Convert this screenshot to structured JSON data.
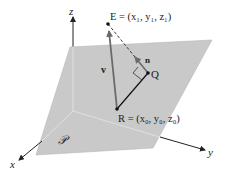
{
  "diagram": {
    "colors": {
      "plane_fill": "#c9c9c9",
      "plane_edge": "#b5b5b5",
      "axis": "#222222",
      "vector_v": "#6a6a6a",
      "segment_RQ": "#111111",
      "normal_n": "#6a6a6a"
    },
    "axes": {
      "x_label": "x",
      "y_label": "y",
      "z_label": "z"
    },
    "plane": {
      "label": "𝒫"
    },
    "points": {
      "E": {
        "name": "E",
        "label": "E = (x₁, y₁, z₁)"
      },
      "Q": {
        "name": "Q",
        "label": "Q"
      },
      "R": {
        "name": "R",
        "label": "R = (x₀, y₀, z₀)"
      }
    },
    "vectors": {
      "v": {
        "label": "v"
      },
      "n": {
        "label": "n"
      }
    }
  }
}
